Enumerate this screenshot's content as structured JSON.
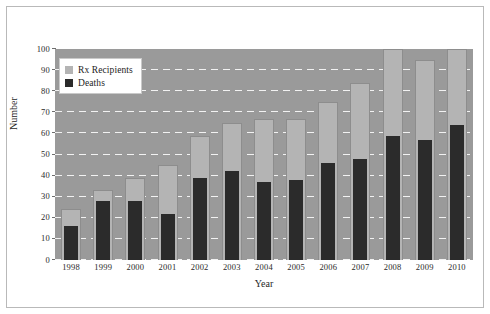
{
  "chart_data": {
    "type": "bar",
    "title": "",
    "xlabel": "Year",
    "ylabel": "Number",
    "categories": [
      "1998",
      "1999",
      "2000",
      "2001",
      "2002",
      "2003",
      "2004",
      "2005",
      "2006",
      "2007",
      "2008",
      "2009",
      "2010"
    ],
    "series": [
      {
        "name": "Rx Recipients",
        "color": "#b4b4b4",
        "values": [
          24,
          33,
          39,
          45,
          59,
          65,
          67,
          67,
          75,
          84,
          100,
          95,
          100
        ]
      },
      {
        "name": "Deaths",
        "color": "#2b2b2b",
        "values": [
          16,
          28,
          28,
          22,
          39,
          42,
          37,
          38,
          46,
          48,
          59,
          57,
          64
        ]
      }
    ],
    "ylim": [
      0,
      100
    ],
    "yticks": [
      0,
      10,
      20,
      30,
      40,
      50,
      60,
      70,
      80,
      90,
      100
    ],
    "ytick_labels": [
      "0",
      "10",
      "20",
      "30",
      "40",
      "50",
      "60",
      "70",
      "80",
      "90",
      "100"
    ],
    "grid": true,
    "grid_style": "dashed-white-horizontal",
    "legend_position": "upper-left-inside",
    "plot_background": "#9a9a9a",
    "figure_background": "#ffffff"
  },
  "legend": {
    "entries": [
      {
        "label": "Rx Recipients",
        "color": "#b4b4b4"
      },
      {
        "label": "Deaths",
        "color": "#2b2b2b"
      }
    ]
  },
  "axes": {
    "x_title": "Year",
    "y_title": "Number"
  }
}
